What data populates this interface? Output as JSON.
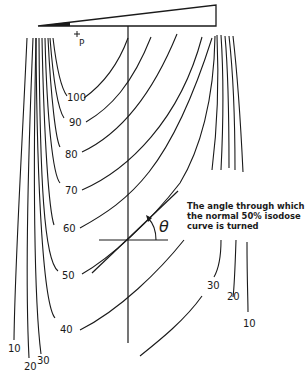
{
  "figure": {
    "point_label": "P",
    "theta_symbol": "θ",
    "annotation": {
      "line1": "The angle through which",
      "line2": "the normal 50% isodose",
      "line3": "curve is turned"
    },
    "isodose_labels_center": [
      "100",
      "90",
      "80",
      "70",
      "60",
      "50",
      "40"
    ],
    "isodose_labels_right": [
      "30",
      "20",
      "10"
    ],
    "isodose_labels_left": [
      "10",
      "20",
      "30"
    ]
  },
  "labels": {
    "l100": "100",
    "l90": "90",
    "l80": "80",
    "l70": "70",
    "l60": "60",
    "l50": "50",
    "l40": "40",
    "r30": "30",
    "r20": "20",
    "r10": "10",
    "left10": "10",
    "left20": "20",
    "left30": "30"
  },
  "colors": {
    "line": "#1a1a1a",
    "background": "#ffffff"
  }
}
